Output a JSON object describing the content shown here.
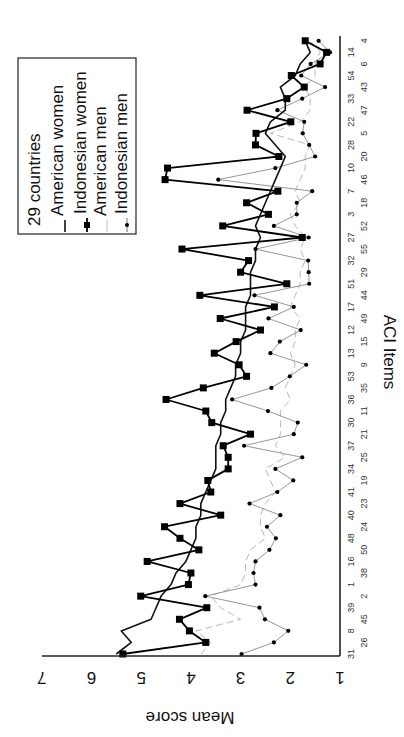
{
  "chart_data": {
    "type": "line",
    "orientation": "rotated-90-clockwise",
    "title": "",
    "xlabel": "ACI Items",
    "ylabel": "Mean score",
    "ylim": [
      1,
      7
    ],
    "yticks": [
      1,
      2,
      3,
      4,
      5,
      6,
      7
    ],
    "grid": false,
    "legend_position": "upper-left (rotated view)",
    "legend_title": "29 countries",
    "categories": [
      "31",
      "26",
      "8",
      "45",
      "39",
      "2",
      "1",
      "38",
      "16",
      "50",
      "48",
      "24",
      "40",
      "23",
      "41",
      "19",
      "34",
      "25",
      "37",
      "21",
      "30",
      "11",
      "36",
      "35",
      "53",
      "9",
      "13",
      "15",
      "12",
      "49",
      "17",
      "44",
      "51",
      "29",
      "32",
      "55",
      "27",
      "52",
      "3",
      "18",
      "7",
      "46",
      "10",
      "20",
      "28",
      "5",
      "22",
      "47",
      "33",
      "43",
      "54",
      "6",
      "14",
      "4"
    ],
    "series": [
      {
        "name": "American women",
        "style": "solid thick black, no markers",
        "color": "#111111",
        "values": [
          5.5,
          5.2,
          5.4,
          4.8,
          4.7,
          4.6,
          4.4,
          4.3,
          4.1,
          4.0,
          3.9,
          3.9,
          3.8,
          3.8,
          3.7,
          3.6,
          3.5,
          3.5,
          3.5,
          3.4,
          3.4,
          3.3,
          3.3,
          3.2,
          3.1,
          3.1,
          3.0,
          3.0,
          2.9,
          2.9,
          2.9,
          2.8,
          2.8,
          2.8,
          2.7,
          2.7,
          2.6,
          2.7,
          2.6,
          2.5,
          2.4,
          2.3,
          2.2,
          2.1,
          2.3,
          2.5,
          2.4,
          2.1,
          2.1,
          2.2,
          1.9,
          1.8,
          1.6,
          1.7
        ]
      },
      {
        "name": "Indonesian women",
        "style": "solid thick black, square markers",
        "color": "#000000",
        "values": [
          5.37,
          3.7,
          4.03,
          4.23,
          3.68,
          5.01,
          4.05,
          4.0,
          4.88,
          3.84,
          4.22,
          4.53,
          3.4,
          4.22,
          3.6,
          3.66,
          3.25,
          3.25,
          3.35,
          2.8,
          3.58,
          3.7,
          4.5,
          3.75,
          2.88,
          3.03,
          3.53,
          3.09,
          2.6,
          3.41,
          2.32,
          3.82,
          2.07,
          3.0,
          2.84,
          4.18,
          1.76,
          3.36,
          2.44,
          2.88,
          2.25,
          4.52,
          4.47,
          2.23,
          2.7,
          2.69,
          1.99,
          2.87,
          2.07,
          1.72,
          1.98,
          1.4,
          1.27,
          1.7
        ]
      },
      {
        "name": "American men",
        "style": "dashed light gray, no markers",
        "color": "#b0b0b0",
        "values": [
          3.8,
          3.6,
          3.9,
          3.0,
          3.4,
          3.6,
          3.0,
          2.9,
          2.9,
          2.8,
          2.5,
          2.6,
          2.6,
          2.5,
          2.3,
          2.4,
          2.5,
          2.1,
          2.3,
          2.2,
          2.2,
          2.2,
          2.0,
          2.1,
          2.0,
          1.9,
          2.0,
          1.9,
          1.9,
          1.8,
          2.0,
          1.9,
          1.8,
          1.8,
          1.7,
          1.8,
          1.7,
          1.9,
          2.0,
          1.8,
          1.9,
          1.8,
          1.7,
          1.7,
          1.6,
          2.4,
          1.8,
          1.6,
          1.6,
          1.7,
          1.5,
          1.5,
          1.4,
          1.6
        ]
      },
      {
        "name": "Indonesian men",
        "style": "solid thin gray, round dot markers",
        "color": "#8a8a8a",
        "values": [
          2.98,
          2.33,
          2.04,
          2.51,
          2.62,
          3.71,
          2.7,
          2.74,
          2.7,
          2.42,
          2.29,
          2.47,
          2.2,
          2.82,
          2.26,
          1.94,
          2.3,
          1.76,
          2.93,
          1.93,
          1.85,
          2.45,
          3.17,
          2.38,
          2.01,
          1.68,
          2.4,
          2.21,
          1.79,
          2.44,
          1.93,
          2.72,
          1.62,
          1.63,
          1.64,
          2.7,
          1.63,
          2.33,
          1.87,
          1.87,
          1.56,
          3.45,
          2.3,
          1.5,
          1.62,
          1.75,
          1.72,
          2.26,
          1.76,
          1.3,
          1.78,
          1.59,
          1.2,
          1.43
        ]
      }
    ]
  },
  "legend": {
    "title": "29 countries",
    "items": [
      "American women",
      "Indonesian women",
      "American men",
      "Indonesian men"
    ]
  },
  "axes": {
    "x_title": "ACI Items",
    "y_title": "Mean score",
    "y_tick_labels": [
      "1",
      "2",
      "3",
      "4",
      "5",
      "6",
      "7"
    ]
  }
}
